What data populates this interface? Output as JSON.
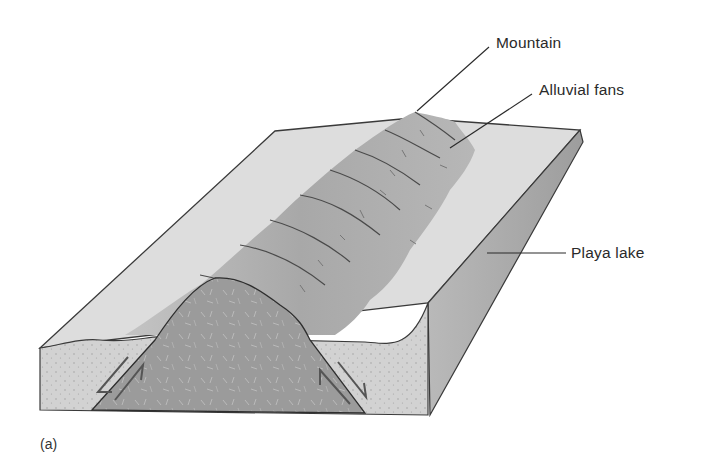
{
  "figure": {
    "caption": "(a)",
    "labels": {
      "mountain": "Mountain",
      "alluvial_fans": "Alluvial fans",
      "playa_lake": "Playa lake"
    },
    "colors": {
      "surface": "#dcdcdc",
      "mountain_fan": "#a9a9a9",
      "bedrock_block": "#9a9a9a",
      "sediment_face": "#cfcfcf",
      "right_face": "#a6a6a6",
      "playa": "#e9e9e9",
      "outline": "#3a3a3a"
    }
  }
}
